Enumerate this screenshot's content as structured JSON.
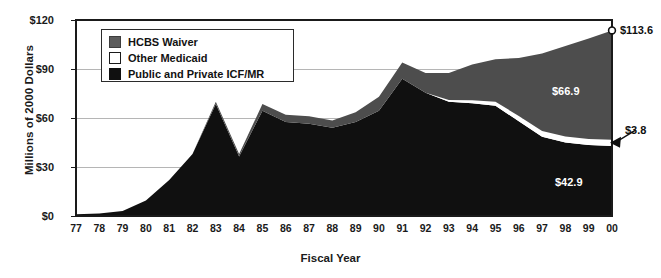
{
  "chart_data": {
    "type": "area",
    "stacked": true,
    "title": "",
    "subtitle": "",
    "xlabel": "Fiscal Year",
    "ylabel": "Millions of 2000 Dollars",
    "categories": [
      "77",
      "78",
      "79",
      "80",
      "81",
      "82",
      "83",
      "84",
      "85",
      "86",
      "87",
      "88",
      "89",
      "90",
      "91",
      "92",
      "93",
      "94",
      "95",
      "96",
      "97",
      "98",
      "99",
      "00"
    ],
    "ylim": [
      0,
      120
    ],
    "yticks": [
      0,
      30,
      60,
      90,
      120
    ],
    "ytick_labels": [
      "$0",
      "$30",
      "$60",
      "$90",
      "$120"
    ],
    "grid": "horizontal",
    "legend_position": "top-left-inside",
    "series": [
      {
        "name": "Public and Private ICF/MR",
        "color": "#101010",
        "order": 1,
        "values": [
          1.0,
          1.6,
          3.0,
          9.5,
          22.0,
          38.0,
          68.5,
          36.5,
          64.5,
          57.5,
          56.5,
          54.0,
          57.5,
          64.5,
          84.0,
          75.5,
          70.0,
          69.0,
          67.5,
          58.0,
          48.5,
          45.0,
          43.5,
          42.9
        ]
      },
      {
        "name": "Other Medicaid",
        "color": "#ffffff",
        "order": 2,
        "values": [
          0.0,
          0.0,
          0.0,
          0.0,
          0.0,
          0.0,
          0.0,
          0.0,
          0.0,
          0.0,
          0.0,
          0.0,
          0.0,
          0.0,
          0.0,
          0.0,
          1.0,
          1.8,
          2.5,
          3.2,
          3.5,
          3.6,
          3.7,
          3.8
        ]
      },
      {
        "name": "HCBS Waiver",
        "color": "#4d4d4d",
        "order": 3,
        "values": [
          0.0,
          0.0,
          0.0,
          0.0,
          0.0,
          0.0,
          1.5,
          1.5,
          4.0,
          4.5,
          4.5,
          4.5,
          6.0,
          8.5,
          10.0,
          12.0,
          16.5,
          22.0,
          26.0,
          35.5,
          47.5,
          55.5,
          61.5,
          66.9
        ]
      }
    ],
    "totals": [
      1.0,
      1.6,
      3.0,
      9.5,
      22.0,
      38.0,
      70.0,
      38.0,
      68.5,
      62.0,
      61.0,
      58.5,
      63.5,
      73.0,
      94.0,
      87.5,
      87.5,
      92.8,
      96.0,
      96.7,
      99.5,
      104.1,
      108.7,
      113.6
    ],
    "annotations": [
      {
        "id": "total-2000",
        "text": "$113.6",
        "series": "Total",
        "year": "00",
        "value": 113.6,
        "style": "marker-circle-right"
      },
      {
        "id": "hcbs-2000",
        "text": "$66.9",
        "series": "HCBS Waiver",
        "year": "00",
        "value": 66.9,
        "style": "inside-white"
      },
      {
        "id": "other-2000",
        "text": "$3.8",
        "series": "Other Medicaid",
        "year": "00",
        "value": 3.8,
        "style": "arrow-right"
      },
      {
        "id": "icf-2000",
        "text": "$42.9",
        "series": "Public and Private ICF/MR",
        "year": "00",
        "value": 42.9,
        "style": "inside-white"
      }
    ],
    "legend": [
      {
        "label": "HCBS Waiver",
        "swatch": "hcbs",
        "color": "#4d4d4d"
      },
      {
        "label": "Other Medicaid",
        "swatch": "other",
        "color": "#ffffff"
      },
      {
        "label": "Public and Private ICF/MR",
        "swatch": "icf",
        "color": "#101010"
      }
    ],
    "colors": {
      "hcbs_waiver": "#4d4d4d",
      "other_medicaid": "#ffffff",
      "icf_mr": "#101010",
      "axis": "#1a1a1a",
      "grid": "#b5b5b5",
      "background": "#ffffff"
    }
  }
}
